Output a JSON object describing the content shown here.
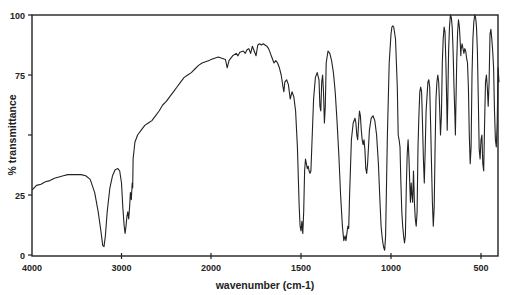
{
  "chart_data": {
    "type": "line",
    "title": "",
    "xlabel": "wavenumber (cm-1)",
    "ylabel": "% transmittance",
    "xlim": [
      4000,
      400
    ],
    "ylim": [
      0,
      100
    ],
    "x_axis_reversed": true,
    "x_scale_note": "split scale: 4000-2000 compressed, 2000-400 expanded",
    "grid": false,
    "legend": null,
    "xticks": [
      4000,
      3000,
      2000,
      1500,
      1000,
      500
    ],
    "xtick_labels": [
      "4000",
      "3000",
      "2000",
      "1500",
      "1000",
      "500"
    ],
    "yticks": [
      0,
      25,
      50,
      75,
      100
    ],
    "ytick_labels": [
      "0",
      "25",
      "",
      "75",
      "100"
    ],
    "line_color": "#222222",
    "series": [
      {
        "name": "IR spectrum",
        "points": [
          [
            4000,
            27
          ],
          [
            3950,
            29
          ],
          [
            3900,
            29.5
          ],
          [
            3850,
            30.5
          ],
          [
            3800,
            31
          ],
          [
            3750,
            32
          ],
          [
            3700,
            32.5
          ],
          [
            3650,
            33
          ],
          [
            3600,
            33.5
          ],
          [
            3550,
            33.5
          ],
          [
            3500,
            33.5
          ],
          [
            3450,
            33.5
          ],
          [
            3400,
            33
          ],
          [
            3350,
            31.5
          ],
          [
            3300,
            26
          ],
          [
            3260,
            18
          ],
          [
            3230,
            10
          ],
          [
            3210,
            4
          ],
          [
            3195,
            3.5
          ],
          [
            3180,
            8
          ],
          [
            3160,
            18
          ],
          [
            3130,
            28
          ],
          [
            3100,
            33
          ],
          [
            3070,
            35.5
          ],
          [
            3040,
            36
          ],
          [
            3020,
            35
          ],
          [
            3000,
            30
          ],
          [
            2985,
            20
          ],
          [
            2970,
            12
          ],
          [
            2960,
            9
          ],
          [
            2950,
            12
          ],
          [
            2940,
            16
          ],
          [
            2930,
            18
          ],
          [
            2920,
            15
          ],
          [
            2910,
            20
          ],
          [
            2900,
            26
          ],
          [
            2890,
            23
          ],
          [
            2880,
            30
          ],
          [
            2875,
            28
          ],
          [
            2870,
            40
          ],
          [
            2850,
            47
          ],
          [
            2820,
            50
          ],
          [
            2780,
            52
          ],
          [
            2740,
            54
          ],
          [
            2700,
            55
          ],
          [
            2660,
            56
          ],
          [
            2620,
            58
          ],
          [
            2580,
            60
          ],
          [
            2540,
            62.5
          ],
          [
            2500,
            64
          ],
          [
            2460,
            66
          ],
          [
            2420,
            68
          ],
          [
            2380,
            70
          ],
          [
            2340,
            72
          ],
          [
            2300,
            74
          ],
          [
            2260,
            75
          ],
          [
            2220,
            76
          ],
          [
            2180,
            77.5
          ],
          [
            2140,
            79
          ],
          [
            2100,
            80
          ],
          [
            2060,
            80.5
          ],
          [
            2020,
            81
          ],
          [
            2000,
            81.5
          ],
          [
            1980,
            82
          ],
          [
            1960,
            82.5
          ],
          [
            1940,
            82
          ],
          [
            1920,
            81.5
          ],
          [
            1910,
            78
          ],
          [
            1900,
            81
          ],
          [
            1880,
            83
          ],
          [
            1860,
            84
          ],
          [
            1850,
            83
          ],
          [
            1840,
            84.5
          ],
          [
            1820,
            85
          ],
          [
            1810,
            84
          ],
          [
            1800,
            85.5
          ],
          [
            1790,
            86
          ],
          [
            1780,
            84
          ],
          [
            1770,
            87
          ],
          [
            1760,
            85
          ],
          [
            1750,
            83
          ],
          [
            1740,
            87.5
          ],
          [
            1730,
            88
          ],
          [
            1720,
            87.5
          ],
          [
            1710,
            88
          ],
          [
            1700,
            87.5
          ],
          [
            1690,
            87
          ],
          [
            1680,
            86
          ],
          [
            1670,
            84
          ],
          [
            1660,
            82
          ],
          [
            1650,
            80
          ],
          [
            1640,
            81
          ],
          [
            1630,
            80
          ],
          [
            1620,
            78
          ],
          [
            1610,
            75
          ],
          [
            1600,
            70
          ],
          [
            1595,
            68
          ],
          [
            1590,
            72
          ],
          [
            1580,
            73
          ],
          [
            1570,
            71
          ],
          [
            1560,
            65
          ],
          [
            1550,
            68
          ],
          [
            1540,
            66
          ],
          [
            1530,
            60
          ],
          [
            1520,
            45
          ],
          [
            1510,
            20
          ],
          [
            1505,
            12
          ],
          [
            1500,
            10
          ],
          [
            1495,
            14
          ],
          [
            1490,
            9
          ],
          [
            1485,
            18
          ],
          [
            1480,
            35
          ],
          [
            1475,
            40
          ],
          [
            1470,
            38
          ],
          [
            1465,
            36
          ],
          [
            1460,
            37
          ],
          [
            1455,
            35
          ],
          [
            1450,
            34
          ],
          [
            1445,
            35
          ],
          [
            1440,
            45
          ],
          [
            1430,
            65
          ],
          [
            1420,
            74
          ],
          [
            1410,
            76
          ],
          [
            1400,
            73
          ],
          [
            1395,
            62
          ],
          [
            1390,
            60
          ],
          [
            1385,
            72
          ],
          [
            1380,
            75
          ],
          [
            1375,
            68
          ],
          [
            1370,
            55
          ],
          [
            1365,
            62
          ],
          [
            1360,
            80
          ],
          [
            1350,
            85
          ],
          [
            1340,
            84
          ],
          [
            1330,
            81
          ],
          [
            1320,
            76
          ],
          [
            1310,
            68
          ],
          [
            1300,
            56
          ],
          [
            1290,
            42
          ],
          [
            1280,
            25
          ],
          [
            1270,
            12
          ],
          [
            1262,
            6
          ],
          [
            1255,
            8
          ],
          [
            1250,
            6
          ],
          [
            1245,
            9
          ],
          [
            1240,
            12
          ],
          [
            1235,
            11
          ],
          [
            1230,
            25
          ],
          [
            1220,
            48
          ],
          [
            1210,
            55
          ],
          [
            1200,
            57
          ],
          [
            1195,
            55
          ],
          [
            1190,
            50
          ],
          [
            1185,
            48
          ],
          [
            1180,
            55
          ],
          [
            1175,
            60
          ],
          [
            1170,
            58
          ],
          [
            1165,
            52
          ],
          [
            1160,
            48
          ],
          [
            1155,
            46
          ],
          [
            1150,
            48
          ],
          [
            1145,
            44
          ],
          [
            1140,
            36
          ],
          [
            1135,
            34
          ],
          [
            1130,
            38
          ],
          [
            1120,
            52
          ],
          [
            1110,
            57
          ],
          [
            1100,
            58
          ],
          [
            1090,
            56
          ],
          [
            1080,
            50
          ],
          [
            1070,
            38
          ],
          [
            1060,
            20
          ],
          [
            1055,
            12
          ],
          [
            1050,
            8
          ],
          [
            1045,
            5
          ],
          [
            1040,
            3
          ],
          [
            1035,
            2
          ],
          [
            1030,
            8
          ],
          [
            1020,
            50
          ],
          [
            1010,
            80
          ],
          [
            1000,
            92
          ],
          [
            995,
            95
          ],
          [
            990,
            95.5
          ],
          [
            985,
            95
          ],
          [
            975,
            90
          ],
          [
            965,
            70
          ],
          [
            960,
            50
          ],
          [
            955,
            48
          ],
          [
            950,
            45
          ],
          [
            945,
            30
          ],
          [
            940,
            18
          ],
          [
            935,
            12
          ],
          [
            930,
            8
          ],
          [
            925,
            5
          ],
          [
            920,
            8
          ],
          [
            915,
            28
          ],
          [
            910,
            42
          ],
          [
            905,
            48
          ],
          [
            900,
            40
          ],
          [
            895,
            28
          ],
          [
            892,
            22
          ],
          [
            888,
            30
          ],
          [
            885,
            26
          ],
          [
            880,
            22
          ],
          [
            875,
            35
          ],
          [
            870,
            22
          ],
          [
            865,
            15
          ],
          [
            860,
            12
          ],
          [
            855,
            18
          ],
          [
            850,
            45
          ],
          [
            845,
            58
          ],
          [
            840,
            68
          ],
          [
            835,
            70
          ],
          [
            830,
            68
          ],
          [
            825,
            55
          ],
          [
            820,
            40
          ],
          [
            815,
            30
          ],
          [
            810,
            44
          ],
          [
            805,
            60
          ],
          [
            800,
            66
          ],
          [
            795,
            72
          ],
          [
            790,
            73
          ],
          [
            785,
            70
          ],
          [
            780,
            55
          ],
          [
            775,
            38
          ],
          [
            770,
            22
          ],
          [
            765,
            12
          ],
          [
            760,
            20
          ],
          [
            755,
            45
          ],
          [
            750,
            65
          ],
          [
            745,
            72
          ],
          [
            740,
            75
          ],
          [
            735,
            72
          ],
          [
            730,
            62
          ],
          [
            725,
            50
          ],
          [
            720,
            58
          ],
          [
            715,
            80
          ],
          [
            710,
            90
          ],
          [
            705,
            95
          ],
          [
            700,
            93
          ],
          [
            695,
            80
          ],
          [
            690,
            62
          ],
          [
            688,
            52
          ],
          [
            685,
            62
          ],
          [
            680,
            85
          ],
          [
            675,
            95
          ],
          [
            670,
            100
          ],
          [
            665,
            99
          ],
          [
            660,
            95
          ],
          [
            655,
            85
          ],
          [
            650,
            70
          ],
          [
            645,
            58
          ],
          [
            642,
            50
          ],
          [
            640,
            60
          ],
          [
            635,
            80
          ],
          [
            630,
            93
          ],
          [
            625,
            98
          ],
          [
            620,
            95
          ],
          [
            615,
            88
          ],
          [
            612,
            83
          ],
          [
            610,
            86
          ],
          [
            605,
            88
          ],
          [
            600,
            86
          ],
          [
            595,
            84
          ],
          [
            590,
            86
          ],
          [
            585,
            85
          ],
          [
            580,
            82
          ],
          [
            575,
            80
          ],
          [
            570,
            70
          ],
          [
            565,
            50
          ],
          [
            560,
            38
          ],
          [
            555,
            45
          ],
          [
            550,
            75
          ],
          [
            545,
            90
          ],
          [
            540,
            97
          ],
          [
            535,
            100
          ],
          [
            530,
            99
          ],
          [
            525,
            95
          ],
          [
            520,
            85
          ],
          [
            515,
            65
          ],
          [
            510,
            44
          ],
          [
            505,
            40
          ],
          [
            500,
            48
          ],
          [
            495,
            50
          ],
          [
            490,
            38
          ],
          [
            485,
            35
          ],
          [
            480,
            55
          ],
          [
            475,
            72
          ],
          [
            470,
            75
          ],
          [
            465,
            70
          ],
          [
            460,
            62
          ],
          [
            455,
            72
          ],
          [
            450,
            92
          ],
          [
            445,
            94
          ],
          [
            440,
            90
          ],
          [
            435,
            85
          ],
          [
            430,
            78
          ],
          [
            425,
            60
          ],
          [
            420,
            48
          ],
          [
            415,
            45
          ],
          [
            410,
            55
          ],
          [
            405,
            78
          ],
          [
            400,
            72
          ]
        ]
      }
    ]
  }
}
